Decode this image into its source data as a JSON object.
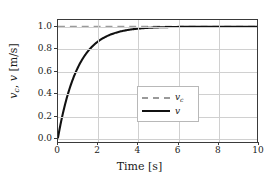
{
  "chart_data": {
    "type": "line",
    "title": "",
    "xlabel": "Time [s]",
    "ylabel": "v_c, v  [m/s]",
    "xlabel_text": "Time",
    "xlabel_unit": "[s]",
    "ylabel_var1": "v",
    "ylabel_var1_sub": "c",
    "ylabel_var2": "v",
    "ylabel_unit": "[m/s]",
    "xlim": [
      0,
      10
    ],
    "ylim": [
      -0.04,
      1.06
    ],
    "grid": true,
    "legend_position": "lower right",
    "xticks": [
      0,
      2,
      4,
      6,
      8,
      10
    ],
    "xtick_labels": [
      "0",
      "2",
      "4",
      "6",
      "8",
      "10"
    ],
    "yticks": [
      0.0,
      0.2,
      0.4,
      0.6,
      0.8,
      1.0
    ],
    "ytick_labels": [
      "0.0",
      "0.2",
      "0.4",
      "0.6",
      "0.8",
      "1.0"
    ],
    "series": [
      {
        "name": "v_c",
        "legend_label": "v_c",
        "style": "dashed",
        "color": "#9a9a9a",
        "x": [
          0,
          10
        ],
        "values": [
          1.0,
          1.0
        ],
        "description": "commanded velocity reference, constant 1.0 m/s"
      },
      {
        "name": "v",
        "legend_label": "v",
        "style": "solid",
        "color": "#111111",
        "description": "first-order step response v = 1 - exp(-t/tau), tau = 1.0 s",
        "x": [
          0.0,
          0.25,
          0.5,
          0.75,
          1.0,
          1.25,
          1.5,
          1.75,
          2.0,
          2.25,
          2.5,
          2.75,
          3.0,
          3.25,
          3.5,
          3.75,
          4.0,
          4.5,
          5.0,
          5.5,
          6.0,
          6.5,
          7.0,
          7.5,
          8.0,
          8.5,
          9.0,
          9.5,
          10.0
        ],
        "values": [
          0.0,
          0.221,
          0.393,
          0.528,
          0.632,
          0.713,
          0.777,
          0.826,
          0.865,
          0.895,
          0.918,
          0.936,
          0.95,
          0.961,
          0.97,
          0.976,
          0.982,
          0.989,
          0.993,
          0.996,
          0.998,
          0.998,
          0.999,
          0.999,
          1.0,
          1.0,
          1.0,
          1.0,
          1.0
        ]
      }
    ]
  },
  "legend": {
    "items": [
      {
        "label_var": "v",
        "label_sub": "c"
      },
      {
        "label_var": "v",
        "label_sub": ""
      }
    ]
  },
  "colors": {
    "reference_line": "#9a9a9a",
    "response_line": "#111111",
    "grid": "#d0d0d0",
    "frame": "#3a3a3a",
    "background": "#ffffff"
  }
}
